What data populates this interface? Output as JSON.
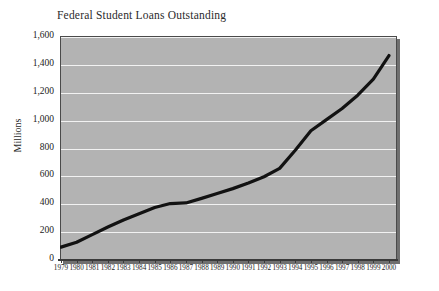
{
  "chart_data": {
    "type": "line",
    "title": "Federal Student Loans Outstanding",
    "xlabel": "",
    "ylabel": "Millions",
    "grid": true,
    "legend": false,
    "xlim": [
      1979,
      2000
    ],
    "ylim": [
      0,
      1600
    ],
    "ytick_labels": [
      "1,600",
      "1,400",
      "1,200",
      "1,000",
      "800",
      "600",
      "400",
      "200",
      "0"
    ],
    "ytick_values": [
      1600,
      1400,
      1200,
      1000,
      800,
      600,
      400,
      200,
      0
    ],
    "categories": [
      "1979",
      "1980",
      "1981",
      "1982",
      "1983",
      "1984",
      "1985",
      "1986",
      "1987",
      "1988",
      "1989",
      "1990",
      "1991",
      "1992",
      "1993",
      "1994",
      "1995",
      "1996",
      "1997",
      "1998",
      "1999",
      "2000"
    ],
    "values": [
      85,
      120,
      175,
      230,
      280,
      325,
      370,
      398,
      402,
      435,
      470,
      505,
      545,
      590,
      650,
      780,
      920,
      1000,
      1080,
      1175,
      1290,
      1460
    ],
    "series": [
      {
        "name": "Federal Student Loans Outstanding",
        "color": "#121212",
        "values": [
          85,
          120,
          175,
          230,
          280,
          325,
          370,
          398,
          402,
          435,
          470,
          505,
          545,
          590,
          650,
          780,
          920,
          1000,
          1080,
          1175,
          1290,
          1460
        ]
      }
    ],
    "plot_background": "#b3b3b3",
    "gridline_color": "#f2f2f2",
    "line_color": "#121212",
    "border_color": "#4a4a4a"
  }
}
